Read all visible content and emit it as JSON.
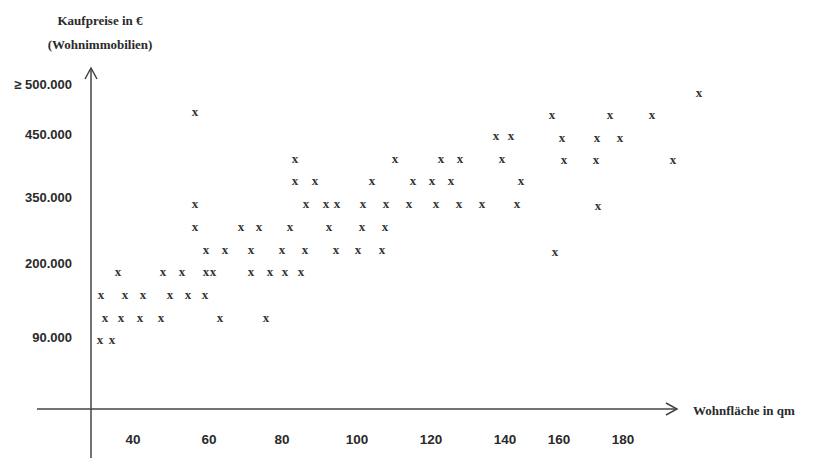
{
  "chart_data": {
    "type": "scatter",
    "title": "",
    "ylabel": "Kaufpreise in € (Wohnimmobilien)",
    "ylabel_lines": [
      "Kaufpreise in €",
      "(Wohnimmobilien)"
    ],
    "xlabel": "Wohnfläche in qm",
    "marker": "x",
    "grid": false,
    "legend": null,
    "x_ticks": [
      "40",
      "60",
      "80",
      "100",
      "120",
      "140",
      "160",
      "180"
    ],
    "y_ticks": [
      "90.000",
      "200.000",
      "350.000",
      "450.000",
      "≥ 500.000"
    ],
    "xlim": [
      30,
      200
    ],
    "ylim": [
      0,
      520000
    ],
    "points": [
      {
        "x": 32,
        "y": 90000,
        "px": 100,
        "py": 341
      },
      {
        "x": 35,
        "y": 90000,
        "px": 112,
        "py": 341
      },
      {
        "x": 33,
        "y": 130000,
        "px": 105,
        "py": 319
      },
      {
        "x": 38,
        "y": 130000,
        "px": 121,
        "py": 319
      },
      {
        "x": 42,
        "y": 130000,
        "px": 140,
        "py": 319
      },
      {
        "x": 48,
        "y": 130000,
        "px": 161,
        "py": 319
      },
      {
        "x": 63,
        "y": 130000,
        "px": 220,
        "py": 319
      },
      {
        "x": 75,
        "y": 130000,
        "px": 266,
        "py": 319
      },
      {
        "x": 32,
        "y": 160000,
        "px": 101,
        "py": 296
      },
      {
        "x": 38,
        "y": 160000,
        "px": 125,
        "py": 296
      },
      {
        "x": 43,
        "y": 160000,
        "px": 143,
        "py": 296
      },
      {
        "x": 50,
        "y": 160000,
        "px": 170,
        "py": 296
      },
      {
        "x": 54,
        "y": 160000,
        "px": 188,
        "py": 296
      },
      {
        "x": 58,
        "y": 160000,
        "px": 205,
        "py": 296
      },
      {
        "x": 36,
        "y": 200000,
        "px": 118,
        "py": 273
      },
      {
        "x": 48,
        "y": 200000,
        "px": 163,
        "py": 273
      },
      {
        "x": 53,
        "y": 200000,
        "px": 182,
        "py": 273
      },
      {
        "x": 59,
        "y": 200000,
        "px": 206,
        "py": 273
      },
      {
        "x": 61,
        "y": 200000,
        "px": 213,
        "py": 273
      },
      {
        "x": 71,
        "y": 200000,
        "px": 251,
        "py": 273
      },
      {
        "x": 76,
        "y": 200000,
        "px": 270,
        "py": 273
      },
      {
        "x": 80,
        "y": 200000,
        "px": 285,
        "py": 273
      },
      {
        "x": 84,
        "y": 200000,
        "px": 301,
        "py": 273
      },
      {
        "x": 59,
        "y": 240000,
        "px": 206,
        "py": 251
      },
      {
        "x": 64,
        "y": 240000,
        "px": 225,
        "py": 251
      },
      {
        "x": 71,
        "y": 240000,
        "px": 251,
        "py": 251
      },
      {
        "x": 79,
        "y": 240000,
        "px": 282,
        "py": 251
      },
      {
        "x": 85,
        "y": 240000,
        "px": 305,
        "py": 251
      },
      {
        "x": 93,
        "y": 240000,
        "px": 336,
        "py": 251
      },
      {
        "x": 99,
        "y": 240000,
        "px": 358,
        "py": 251
      },
      {
        "x": 106,
        "y": 240000,
        "px": 382,
        "py": 251
      },
      {
        "x": 159,
        "y": 240000,
        "px": 555,
        "py": 253
      },
      {
        "x": 56,
        "y": 290000,
        "px": 195,
        "py": 228
      },
      {
        "x": 68,
        "y": 290000,
        "px": 241,
        "py": 228
      },
      {
        "x": 73,
        "y": 290000,
        "px": 259,
        "py": 228
      },
      {
        "x": 81,
        "y": 290000,
        "px": 290,
        "py": 228
      },
      {
        "x": 91,
        "y": 290000,
        "px": 329,
        "py": 228
      },
      {
        "x": 100,
        "y": 290000,
        "px": 362,
        "py": 228
      },
      {
        "x": 106,
        "y": 290000,
        "px": 385,
        "py": 228
      },
      {
        "x": 56,
        "y": 330000,
        "px": 195,
        "py": 205
      },
      {
        "x": 86,
        "y": 330000,
        "px": 306,
        "py": 205
      },
      {
        "x": 91,
        "y": 330000,
        "px": 326,
        "py": 205
      },
      {
        "x": 94,
        "y": 330000,
        "px": 337,
        "py": 205
      },
      {
        "x": 100,
        "y": 330000,
        "px": 363,
        "py": 205
      },
      {
        "x": 107,
        "y": 330000,
        "px": 386,
        "py": 205
      },
      {
        "x": 113,
        "y": 330000,
        "px": 409,
        "py": 205
      },
      {
        "x": 120,
        "y": 330000,
        "px": 436,
        "py": 205
      },
      {
        "x": 126,
        "y": 330000,
        "px": 459,
        "py": 205
      },
      {
        "x": 132,
        "y": 330000,
        "px": 482,
        "py": 205
      },
      {
        "x": 141,
        "y": 330000,
        "px": 517,
        "py": 205
      },
      {
        "x": 171,
        "y": 330000,
        "px": 598,
        "py": 207
      },
      {
        "x": 83,
        "y": 370000,
        "px": 295,
        "py": 182
      },
      {
        "x": 88,
        "y": 370000,
        "px": 315,
        "py": 182
      },
      {
        "x": 103,
        "y": 370000,
        "px": 372,
        "py": 182
      },
      {
        "x": 114,
        "y": 370000,
        "px": 413,
        "py": 182
      },
      {
        "x": 119,
        "y": 370000,
        "px": 432,
        "py": 182
      },
      {
        "x": 124,
        "y": 370000,
        "px": 451,
        "py": 182
      },
      {
        "x": 142,
        "y": 370000,
        "px": 521,
        "py": 182
      },
      {
        "x": 83,
        "y": 410000,
        "px": 295,
        "py": 160
      },
      {
        "x": 109,
        "y": 410000,
        "px": 395,
        "py": 160
      },
      {
        "x": 121,
        "y": 410000,
        "px": 441,
        "py": 160
      },
      {
        "x": 126,
        "y": 410000,
        "px": 460,
        "py": 160
      },
      {
        "x": 137,
        "y": 410000,
        "px": 502,
        "py": 160
      },
      {
        "x": 162,
        "y": 410000,
        "px": 564,
        "py": 161
      },
      {
        "x": 170,
        "y": 410000,
        "px": 596,
        "py": 161
      },
      {
        "x": 189,
        "y": 410000,
        "px": 673,
        "py": 161
      },
      {
        "x": 135,
        "y": 450000,
        "px": 496,
        "py": 137
      },
      {
        "x": 139,
        "y": 450000,
        "px": 511,
        "py": 137
      },
      {
        "x": 161,
        "y": 450000,
        "px": 562,
        "py": 139
      },
      {
        "x": 170,
        "y": 450000,
        "px": 597,
        "py": 139
      },
      {
        "x": 176,
        "y": 450000,
        "px": 620,
        "py": 139
      },
      {
        "x": 56,
        "y": 490000,
        "px": 195,
        "py": 113
      },
      {
        "x": 159,
        "y": 490000,
        "px": 552,
        "py": 116
      },
      {
        "x": 174,
        "y": 490000,
        "px": 610,
        "py": 116
      },
      {
        "x": 185,
        "y": 490000,
        "px": 652,
        "py": 116
      },
      {
        "x": 196,
        "y": 510000,
        "px": 699,
        "py": 94
      }
    ]
  },
  "axes": {
    "y_title_line1": "Kaufpreise in €",
    "y_title_line2": "(Wohnimmobilien)",
    "x_title": "Wohnfläche in qm",
    "y_labels": [
      {
        "text": "≥ 500.000",
        "py": 85
      },
      {
        "text": "450.000",
        "py": 135
      },
      {
        "text": "350.000",
        "py": 198
      },
      {
        "text": "200.000",
        "py": 264
      },
      {
        "text": "90.000",
        "py": 338
      }
    ],
    "x_labels": [
      {
        "text": "40",
        "px": 133
      },
      {
        "text": "60",
        "px": 209
      },
      {
        "text": "80",
        "px": 282
      },
      {
        "text": "100",
        "px": 357
      },
      {
        "text": "120",
        "px": 431
      },
      {
        "text": "140",
        "px": 505
      },
      {
        "text": "160",
        "px": 559
      },
      {
        "text": "180",
        "px": 623
      }
    ],
    "marker_glyph": "x",
    "line_color": "#444444",
    "text_color": "#2a2a2a"
  }
}
